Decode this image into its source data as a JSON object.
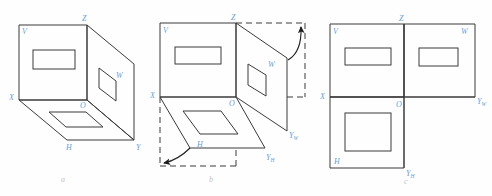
{
  "figure": {
    "axis_label_color": "#6a9fd4",
    "line_color": "#3a3a3a",
    "caption_color": "#b9c3cf"
  },
  "captions": [
    {
      "key": "a",
      "label": "a"
    },
    {
      "key": "b",
      "label": "b"
    },
    {
      "key": "c",
      "label": "c"
    }
  ],
  "panels": [
    {
      "key": "a",
      "caption": "a",
      "description": "Three mutually perpendicular projection planes forming an open box",
      "labels": [
        {
          "name": "plane-v",
          "text": "V"
        },
        {
          "name": "plane-h",
          "text": "H"
        },
        {
          "name": "plane-w",
          "text": "W"
        },
        {
          "name": "axis-x",
          "text": "X"
        },
        {
          "name": "axis-y",
          "text": "Y"
        },
        {
          "name": "axis-z",
          "text": "Z"
        },
        {
          "name": "origin-o",
          "text": "O"
        }
      ]
    },
    {
      "key": "b",
      "caption": "b",
      "description": "Planes rotating open; H plane swings down, W plane swings right",
      "labels": [
        {
          "name": "plane-v",
          "text": "V"
        },
        {
          "name": "plane-h",
          "text": "H"
        },
        {
          "name": "plane-w",
          "text": "W"
        },
        {
          "name": "axis-x",
          "text": "X"
        },
        {
          "name": "axis-z",
          "text": "Z"
        },
        {
          "name": "origin-o",
          "text": "O"
        },
        {
          "name": "axis-y-w",
          "text": "Y",
          "sub": "W"
        },
        {
          "name": "axis-y-h",
          "text": "Y",
          "sub": "H"
        }
      ]
    },
    {
      "key": "c",
      "caption": "c",
      "description": "Planes unfolded flat into the standard three-view layout",
      "labels": [
        {
          "name": "plane-v",
          "text": "V"
        },
        {
          "name": "plane-h",
          "text": "H"
        },
        {
          "name": "plane-w",
          "text": "W"
        },
        {
          "name": "axis-x",
          "text": "X"
        },
        {
          "name": "axis-z",
          "text": "Z"
        },
        {
          "name": "origin-o",
          "text": "O"
        },
        {
          "name": "axis-y-w",
          "text": "Y",
          "sub": "W"
        },
        {
          "name": "axis-y-h",
          "text": "Y",
          "sub": "H"
        }
      ]
    }
  ]
}
